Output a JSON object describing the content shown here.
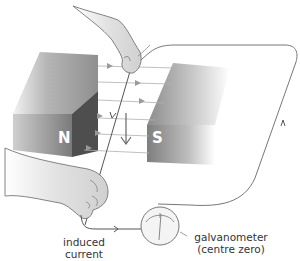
{
  "diagram": {
    "magnets": {
      "north_label": "N",
      "south_label": "S"
    },
    "labels": {
      "induced_current_line1": "induced",
      "induced_current_line2": "current",
      "galvanometer_line1": "galvanometer",
      "galvanometer_line2": "(centre zero)"
    },
    "motion_direction": "down",
    "colors": {
      "magnet_light": "#b8b8b8",
      "magnet_dark": "#5a5a5a",
      "field_lines": "#aaaaaa",
      "wire": "#555555",
      "hand_fill": "#e6e6e6",
      "text": "#333333"
    }
  }
}
